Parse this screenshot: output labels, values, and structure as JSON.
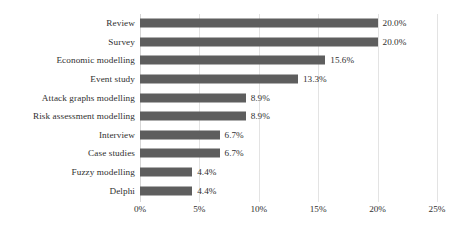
{
  "chart_data": {
    "type": "bar",
    "orientation": "horizontal",
    "title": "",
    "subtitle": "",
    "xlabel": "",
    "ylabel": "",
    "categories": [
      "Review",
      "Survey",
      "Economic modelling",
      "Event study",
      "Attack graphs modelling",
      "Risk assessment modelling",
      "Interview",
      "Case studies",
      "Fuzzy modelling",
      "Delphi"
    ],
    "values": [
      20.0,
      20.0,
      15.6,
      13.3,
      8.9,
      8.9,
      6.7,
      6.7,
      4.4,
      4.4
    ],
    "value_labels": [
      "20.0%",
      "20.0%",
      "15.6%",
      "13.3%",
      "8.9%",
      "8.9%",
      "6.7%",
      "6.7%",
      "4.4%",
      "4.4%"
    ],
    "xlim": [
      0,
      25
    ],
    "xticks": [
      0,
      5,
      10,
      15,
      20,
      25
    ],
    "xtick_labels": [
      "0%",
      "5%",
      "10%",
      "15%",
      "20%",
      "25%"
    ],
    "grid": "vertical",
    "legend": "none",
    "bar_color": "#5e5e5e",
    "gridline_color": "#e3e3e3",
    "background_color": "#ffffff",
    "text_color": "#2f2f2f"
  }
}
